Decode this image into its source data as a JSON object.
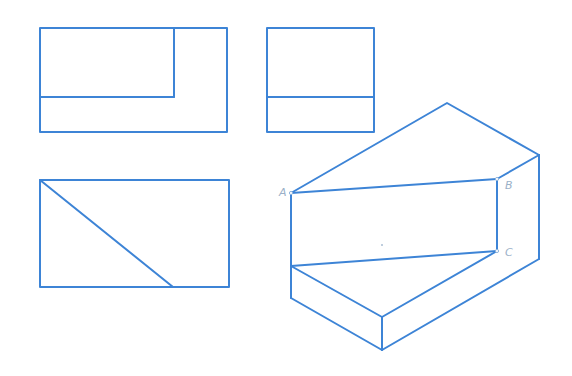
{
  "diagram": {
    "type": "three-view orthographic projection with isometric solid",
    "line_color": "#3d84d6",
    "label_color": "#9ab0c8",
    "views": {
      "front_view": {
        "outer_rect": {
          "x1": 40,
          "y1": 28,
          "x2": 227,
          "y2": 132
        },
        "inner_lines": [
          {
            "x1": 174,
            "y1": 28,
            "x2": 174,
            "y2": 97
          },
          {
            "x1": 40,
            "y1": 97,
            "x2": 174,
            "y2": 97
          }
        ]
      },
      "side_view": {
        "outer_rect": {
          "x1": 267,
          "y1": 28,
          "x2": 374,
          "y2": 132
        },
        "inner_lines": [
          {
            "x1": 267,
            "y1": 97,
            "x2": 374,
            "y2": 97
          }
        ]
      },
      "top_view": {
        "outer_rect": {
          "x1": 40,
          "y1": 180,
          "x2": 229,
          "y2": 287
        },
        "inner_lines": [
          {
            "x1": 40,
            "y1": 180,
            "x2": 173,
            "y2": 287
          }
        ]
      }
    },
    "solid": {
      "vertices": {
        "apex": [
          447,
          103
        ],
        "right_top": [
          539,
          155
        ],
        "A": [
          291,
          193
        ],
        "B": [
          497,
          179
        ],
        "C": [
          497,
          251
        ],
        "left_mid": [
          291,
          266
        ],
        "right_bottom": [
          539,
          259
        ],
        "front_top": [
          382,
          317
        ],
        "left_bottom": [
          291,
          298
        ],
        "front_bottom": [
          382,
          350
        ]
      },
      "labels": [
        {
          "text": "A",
          "x": 279,
          "y": 196
        },
        {
          "text": "B",
          "x": 505,
          "y": 189
        },
        {
          "text": "C",
          "x": 505,
          "y": 256
        }
      ]
    }
  }
}
